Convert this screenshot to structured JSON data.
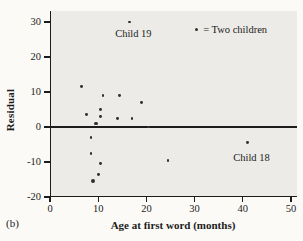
{
  "figure_label": "(b)",
  "legend": {
    "symbol": "two-children-dot",
    "text": "= Two children"
  },
  "annotations": [
    {
      "text": "Child 19",
      "x": 17.3,
      "y": 27
    },
    {
      "text": "Child 18",
      "x": 41.8,
      "y": -8.6
    }
  ],
  "colors": {
    "plot_background": "#edebe7",
    "page_background": "#fbfaf7",
    "axis_line": "#1c1c1c",
    "dot": "#333130",
    "text": "#1b1b1b"
  },
  "chart_data": {
    "type": "scatter",
    "title": "",
    "xlabel": "Age at first word (months)",
    "ylabel": "Residual",
    "xlim": [
      0,
      51.5
    ],
    "ylim": [
      -20,
      33
    ],
    "x_ticks": [
      0,
      10,
      20,
      30,
      40,
      50
    ],
    "y_ticks": [
      30,
      20,
      10,
      0,
      -10,
      -20
    ],
    "reference_line_y": 0,
    "grid": false,
    "legend_position": "top-right",
    "points": [
      {
        "x": 16.5,
        "y": 30,
        "two_children": false
      },
      {
        "x": 6.5,
        "y": 11.5,
        "two_children": false
      },
      {
        "x": 11,
        "y": 9,
        "two_children": false
      },
      {
        "x": 14.5,
        "y": 9,
        "two_children": false
      },
      {
        "x": 19,
        "y": 7,
        "two_children": false
      },
      {
        "x": 10.5,
        "y": 5,
        "two_children": false
      },
      {
        "x": 7.5,
        "y": 3.5,
        "two_children": false
      },
      {
        "x": 10.5,
        "y": 3,
        "two_children": false
      },
      {
        "x": 14,
        "y": 2.5,
        "two_children": false
      },
      {
        "x": 17,
        "y": 2.5,
        "two_children": false
      },
      {
        "x": 9.5,
        "y": 1,
        "two_children": true
      },
      {
        "x": 20.5,
        "y": 0,
        "two_children": false
      },
      {
        "x": 8.5,
        "y": -3,
        "two_children": false
      },
      {
        "x": 8.5,
        "y": -7.5,
        "two_children": false
      },
      {
        "x": 10.5,
        "y": -10.5,
        "two_children": false
      },
      {
        "x": 10,
        "y": -13.5,
        "two_children": false
      },
      {
        "x": 9,
        "y": -15.5,
        "two_children": true
      },
      {
        "x": 24.5,
        "y": -9.5,
        "two_children": false
      },
      {
        "x": 41,
        "y": -4.5,
        "two_children": false
      }
    ]
  }
}
